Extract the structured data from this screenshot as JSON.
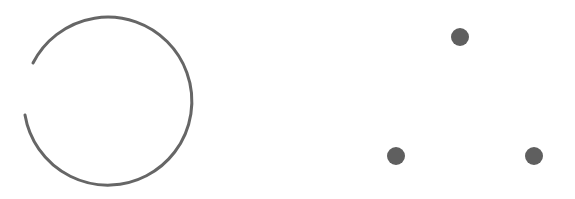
{
  "figure": {
    "background": "#ffffff",
    "stroke_color": "#666666",
    "fill_color": "#5f5f5f",
    "broken_ring": {
      "shape": "circle-with-gap",
      "center": [
        110,
        100
      ],
      "radius": 84,
      "stroke_width": 3,
      "gap_side": "left"
    },
    "dots": [
      {
        "label": "top",
        "cx": 460,
        "cy": 37,
        "r": 9
      },
      {
        "label": "bottom-left",
        "cx": 396,
        "cy": 156,
        "r": 9
      },
      {
        "label": "bottom-right",
        "cx": 534,
        "cy": 156,
        "r": 9
      }
    ]
  }
}
